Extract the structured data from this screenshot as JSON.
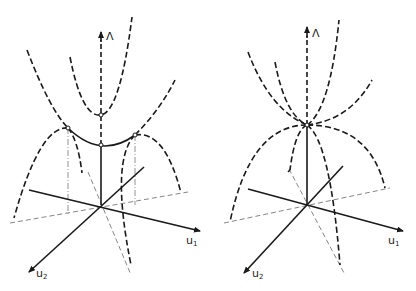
{
  "figure": {
    "left_panel": {
      "axis_labels": {
        "vertical": "Λ",
        "u1": "u",
        "u1_sub": "1",
        "u2": "u",
        "u2_sub": "2"
      }
    },
    "right_panel": {
      "axis_labels": {
        "vertical": "Λ",
        "u1": "u",
        "u1_sub": "1",
        "u2": "u",
        "u2_sub": "2"
      }
    },
    "colors": {
      "ink": "#1a1a1a",
      "background": "#ffffff",
      "faint": "#666666"
    }
  }
}
